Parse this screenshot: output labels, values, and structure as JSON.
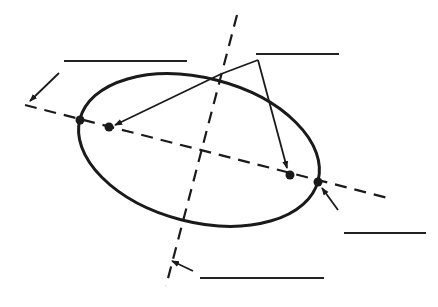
{
  "diagram": {
    "title": "",
    "shape": "ellipse",
    "stroke_color": "#1a1a1a",
    "background": "#ffffff",
    "ellipse": {
      "cx": 199,
      "cy": 150,
      "rx": 123,
      "ry": 72,
      "rotation_deg": 14.5
    },
    "major_axis": {
      "x1": 25,
      "y1": 105,
      "x2": 388,
      "y2": 198,
      "style": "dashed"
    },
    "minor_axis": {
      "x1": 237,
      "y1": 15,
      "x2": 166,
      "y2": 286,
      "style": "dashed"
    },
    "points": [
      {
        "name": "vertex-left",
        "x": 80,
        "y": 120
      },
      {
        "name": "focus-left",
        "x": 109,
        "y": 127
      },
      {
        "name": "focus-right",
        "x": 290,
        "y": 175
      },
      {
        "name": "vertex-right",
        "x": 318,
        "y": 182
      }
    ],
    "label_blanks": [
      {
        "name": "label-blank-top-left",
        "x": 64,
        "y": 60,
        "width": 123,
        "text": ""
      },
      {
        "name": "label-blank-top-right",
        "x": 256,
        "y": 53,
        "width": 83,
        "text": ""
      },
      {
        "name": "label-blank-right",
        "x": 344,
        "y": 232,
        "width": 82,
        "text": ""
      },
      {
        "name": "label-blank-bottom",
        "x": 200,
        "y": 277,
        "width": 124,
        "text": ""
      }
    ]
  }
}
